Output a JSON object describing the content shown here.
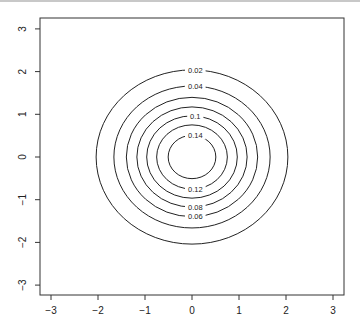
{
  "chart_data": {
    "type": "contour",
    "title": "",
    "xlabel": "",
    "ylabel": "",
    "xlim": [
      -3.2,
      3.2
    ],
    "ylim": [
      -3.2,
      3.2
    ],
    "x_ticks": [
      -3,
      -2,
      -1,
      0,
      1,
      2,
      3
    ],
    "y_ticks": [
      -3,
      -2,
      -1,
      0,
      1,
      2,
      3
    ],
    "x_tick_labels": [
      "−3",
      "−2",
      "−1",
      "0",
      "1",
      "2",
      "3"
    ],
    "y_tick_labels": [
      "−3",
      "−2",
      "−1",
      "0",
      "1",
      "2",
      "3"
    ],
    "grid": false,
    "center": [
      0,
      0
    ],
    "levels": [
      0.02,
      0.04,
      0.06,
      0.08,
      0.1,
      0.12,
      0.14
    ],
    "radii": [
      2.04,
      1.662,
      1.397,
      1.173,
      0.964,
      0.752,
      0.507
    ],
    "contour_labels": [
      {
        "text": "0.02",
        "level": 0.02,
        "position": "top"
      },
      {
        "text": "0.04",
        "level": 0.04,
        "position": "top"
      },
      {
        "text": "0.1",
        "level": 0.1,
        "position": "top"
      },
      {
        "text": "0.14",
        "level": 0.14,
        "position": "top"
      },
      {
        "text": "0.12",
        "level": 0.12,
        "position": "bottom"
      },
      {
        "text": "0.08",
        "level": 0.08,
        "position": "bottom"
      },
      {
        "text": "0.06",
        "level": 0.06,
        "position": "bottom"
      }
    ]
  },
  "colors": {
    "line": "#222222",
    "axis": "#333333",
    "background": "#ffffff"
  }
}
